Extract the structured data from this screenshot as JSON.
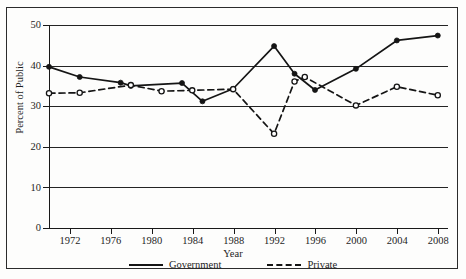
{
  "figure": {
    "xlabel": "Year",
    "ylabel": "Percent of Public"
  },
  "legend": {
    "items": [
      {
        "label": "Government",
        "style": "solid",
        "color": "#151515"
      },
      {
        "label": "Private",
        "style": "dashed",
        "color": "#151515"
      }
    ]
  },
  "axes": {
    "y_ticks": [
      "0",
      "10",
      "20",
      "30",
      "40",
      "50"
    ],
    "x_ticks": [
      "1972",
      "1976",
      "1980",
      "1984",
      "1988",
      "1992",
      "1996",
      "2000",
      "2004",
      "2008"
    ]
  },
  "chart_data": {
    "type": "line",
    "title": "",
    "xlabel": "Year",
    "ylabel": "Percent of Public",
    "xlim": [
      1970,
      2009
    ],
    "ylim": [
      0,
      50
    ],
    "yticks": [
      0,
      10,
      20,
      30,
      40,
      50
    ],
    "xticks": [
      1972,
      1976,
      1980,
      1984,
      1988,
      1992,
      1996,
      2000,
      2004,
      2008
    ],
    "grid": "horizontal",
    "legend_position": "bottom-center",
    "series": [
      {
        "name": "Government",
        "style": "solid",
        "marker": "filled-circle",
        "color": "#151515",
        "points": [
          {
            "x": 1970,
            "y": 39.7
          },
          {
            "x": 1973,
            "y": 37.2
          },
          {
            "x": 1977,
            "y": 35.8
          },
          {
            "x": 1978,
            "y": 35.0
          },
          {
            "x": 1983,
            "y": 35.7
          },
          {
            "x": 1985,
            "y": 31.2
          },
          {
            "x": 1988,
            "y": 34.3
          },
          {
            "x": 1992,
            "y": 44.8
          },
          {
            "x": 1994,
            "y": 38.0
          },
          {
            "x": 1996,
            "y": 34.0
          },
          {
            "x": 2000,
            "y": 39.2
          },
          {
            "x": 2004,
            "y": 46.2
          },
          {
            "x": 2008,
            "y": 47.4
          }
        ]
      },
      {
        "name": "Private",
        "style": "dashed",
        "marker": "open-circle",
        "color": "#151515",
        "points": [
          {
            "x": 1970,
            "y": 33.2
          },
          {
            "x": 1973,
            "y": 33.3
          },
          {
            "x": 1978,
            "y": 35.2
          },
          {
            "x": 1981,
            "y": 33.7
          },
          {
            "x": 1984,
            "y": 33.9
          },
          {
            "x": 1988,
            "y": 34.2
          },
          {
            "x": 1992,
            "y": 23.2
          },
          {
            "x": 1994,
            "y": 36.1
          },
          {
            "x": 1995,
            "y": 37.2
          },
          {
            "x": 2000,
            "y": 30.2
          },
          {
            "x": 2004,
            "y": 34.8
          },
          {
            "x": 2008,
            "y": 32.7
          }
        ]
      }
    ]
  }
}
